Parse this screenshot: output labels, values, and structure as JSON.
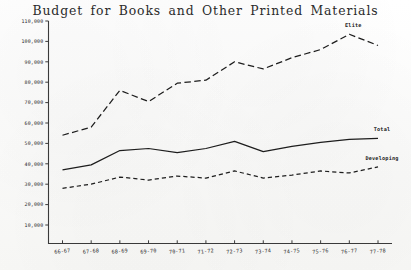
{
  "chart_data": {
    "type": "line",
    "title": "Budget for Books and Other Printed Materials",
    "xlabel": "",
    "ylabel": "",
    "grid": false,
    "legend_position": "inline-right",
    "categories": [
      "66-67",
      "67-68",
      "68-69",
      "69-70",
      "70-71",
      "71-72",
      "72-73",
      "73-74",
      "74-75",
      "75-76",
      "76-77",
      "77-78"
    ],
    "ylim": [
      0,
      110000
    ],
    "yticks": [
      10000,
      20000,
      30000,
      40000,
      50000,
      60000,
      70000,
      80000,
      90000,
      100000,
      110000
    ],
    "ytick_labels": [
      "10,000",
      "20,000",
      "30,000",
      "40,000",
      "50,000",
      "60,000",
      "70,000",
      "80,000",
      "90,000",
      "100,000",
      "110,000"
    ],
    "series": [
      {
        "name": "Elite",
        "style": "long-dash",
        "values": [
          54000,
          58000,
          76000,
          70500,
          79500,
          81000,
          90000,
          86500,
          92000,
          96000,
          103500,
          98000
        ]
      },
      {
        "name": "Total",
        "style": "solid",
        "values": [
          37000,
          39500,
          46500,
          47500,
          45500,
          47500,
          51000,
          46000,
          48500,
          50500,
          52000,
          52500
        ]
      },
      {
        "name": "Developing",
        "style": "short-dash",
        "values": [
          28000,
          30000,
          33500,
          32000,
          34000,
          33000,
          36500,
          33000,
          34500,
          36500,
          35500,
          38500
        ]
      }
    ]
  },
  "axis": {
    "y_axis_name": "budget-amount",
    "x_axis_name": "fiscal-year"
  }
}
